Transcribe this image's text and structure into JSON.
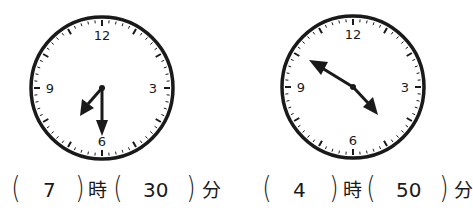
{
  "clocks": [
    {
      "id": "clock-1",
      "numerals": {
        "twelve": "12",
        "three": "3",
        "six": "6",
        "nine": "9"
      },
      "hour_hand_time": "7:30",
      "answer": {
        "hour": "7",
        "minute": "30",
        "hour_unit": "時",
        "minute_unit": "分"
      }
    },
    {
      "id": "clock-2",
      "numerals": {
        "twelve": "12",
        "three": "3",
        "six": "6",
        "nine": "9"
      },
      "hour_hand_time": "4:50",
      "answer": {
        "hour": "4",
        "minute": "50",
        "hour_unit": "時",
        "minute_unit": "分"
      }
    }
  ],
  "glyphs": {
    "open_paren": "(",
    "close_paren": ")"
  },
  "colors": {
    "ink": "#1a1a1a",
    "background": "#ffffff"
  }
}
